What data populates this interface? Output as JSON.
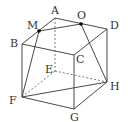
{
  "diagram": {
    "type": "cube",
    "vertices": {
      "A": {
        "x": 55,
        "y": 18
      },
      "B": {
        "x": 22,
        "y": 44
      },
      "C": {
        "x": 74,
        "y": 55
      },
      "D": {
        "x": 107,
        "y": 29
      },
      "E": {
        "x": 55,
        "y": 71
      },
      "F": {
        "x": 22,
        "y": 97
      },
      "G": {
        "x": 74,
        "y": 109
      },
      "H": {
        "x": 107,
        "y": 82
      },
      "M": {
        "x": 39,
        "y": 31
      },
      "O": {
        "x": 81,
        "y": 24
      }
    },
    "labels": {
      "A": "A",
      "B": "B",
      "C": "C",
      "D": "D",
      "E": "E",
      "F": "F",
      "G": "G",
      "H": "H",
      "M": "M",
      "O": "O"
    },
    "solid_edges": [
      [
        "A",
        "B"
      ],
      [
        "A",
        "D"
      ],
      [
        "B",
        "C"
      ],
      [
        "C",
        "D"
      ],
      [
        "B",
        "F"
      ],
      [
        "C",
        "G"
      ],
      [
        "D",
        "H"
      ],
      [
        "F",
        "G"
      ],
      [
        "G",
        "H"
      ],
      [
        "M",
        "F"
      ],
      [
        "O",
        "H"
      ],
      [
        "M",
        "O"
      ],
      [
        "F",
        "H"
      ]
    ],
    "dashed_edges": [
      [
        "A",
        "E"
      ],
      [
        "E",
        "F"
      ],
      [
        "E",
        "H"
      ]
    ],
    "points": [
      "M",
      "O"
    ],
    "colors": {
      "line": "#333333",
      "dashed": "#555555",
      "point": "#000000"
    }
  }
}
